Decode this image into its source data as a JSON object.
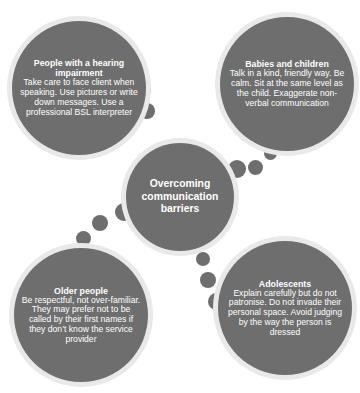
{
  "diagram": {
    "title": "Overcoming communication barriers",
    "colors": {
      "bubble_fill": "#6e6e6e",
      "bubble_ring": "#e9e9e9",
      "text": "#ffffff",
      "background": "#ffffff",
      "connector_dot": "#6e6e6e"
    },
    "hub": {
      "label": "Overcoming communication barriers"
    },
    "nodes": [
      {
        "id": "hearing-impairment",
        "title": "People with a hearing impairment",
        "body": "Take care to face client when speaking. Use pictures or write down messages. Use a professional BSL interpreter"
      },
      {
        "id": "babies-and-children",
        "title": "Babies and children",
        "body": "Talk in a kind, friendly way. Be calm. Sit at the same level as the child. Exaggerate non-verbal communication"
      },
      {
        "id": "older-people",
        "title": "Older people",
        "body": "Be respectful, not over-familiar. They may prefer not to be called by their first names if they don’t know the service provider"
      },
      {
        "id": "adolescents",
        "title": "Adolescents",
        "body": "Explain carefully but do not patronise. Do not invade their personal space. Avoid judging by the way the person is dressed"
      }
    ]
  }
}
